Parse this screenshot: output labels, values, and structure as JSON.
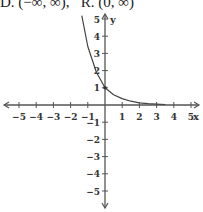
{
  "caption": {
    "domain_label": "D.",
    "domain_value": "(−∞, ∞),",
    "range_label": "R.",
    "range_value": "(0, ∞)"
  },
  "chart_data": {
    "type": "line",
    "title": "",
    "function": "y = (1/2)^x style exponential decay",
    "xlabel": "x",
    "ylabel": "y",
    "xlim": [
      -5,
      5
    ],
    "ylim": [
      -5,
      5
    ],
    "grid": false,
    "x_ticks": [
      "-5",
      "-4",
      "-3",
      "-2",
      "-1",
      "1",
      "2",
      "3",
      "4",
      "5"
    ],
    "y_ticks": [
      "5",
      "4",
      "3",
      "2",
      "1",
      "-1",
      "-2",
      "-3",
      "-4",
      "-5"
    ],
    "series": [
      {
        "name": "curve",
        "x": [
          -1.35,
          -1,
          -0.5,
          0,
          0.5,
          1,
          1.5,
          2,
          2.5,
          3,
          3.5
        ],
        "y": [
          5.2,
          3.4,
          1.9,
          1.0,
          0.6,
          0.37,
          0.22,
          0.13,
          0.08,
          0.05,
          0.03
        ]
      }
    ],
    "annotations": [
      "D. (−∞, ∞),  R. (0, ∞)"
    ]
  }
}
